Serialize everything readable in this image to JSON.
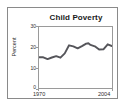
{
  "figure": {
    "background_color": "#ffffff",
    "frame_color": "#8a8a8a",
    "axis_color": "#9a9a9a"
  },
  "chart_data": {
    "type": "line",
    "title": "Child Poverty",
    "xlabel": "",
    "ylabel": "Percent",
    "xlim": [
      1970,
      2004
    ],
    "ylim": [
      0,
      30
    ],
    "grid": false,
    "legend": null,
    "line_color": "#55555a",
    "xtick_labels": [
      "1970",
      "2004"
    ],
    "ytick_labels": [
      "0",
      "10",
      "20",
      "30"
    ],
    "ytick_values": [
      0,
      10,
      20,
      30
    ],
    "x": [
      1970,
      1972,
      1974,
      1976,
      1978,
      1980,
      1982,
      1984,
      1986,
      1988,
      1990,
      1992,
      1993,
      1994,
      1996,
      1998,
      2000,
      2002,
      2004
    ],
    "values": [
      15.1,
      15.1,
      14.2,
      15.0,
      15.7,
      14.9,
      17.0,
      21.0,
      20.5,
      19.5,
      20.6,
      21.8,
      22.0,
      21.2,
      20.5,
      18.9,
      19.0,
      21.5,
      20.6
    ],
    "series": [
      {
        "name": "Child Poverty Rate",
        "values": [
          15.1,
          15.1,
          14.2,
          15.0,
          15.7,
          14.9,
          17.0,
          21.0,
          20.5,
          19.5,
          20.6,
          21.8,
          22.0,
          21.2,
          20.5,
          18.9,
          19.0,
          21.5,
          20.6
        ]
      }
    ],
    "end_value": 18.4
  }
}
